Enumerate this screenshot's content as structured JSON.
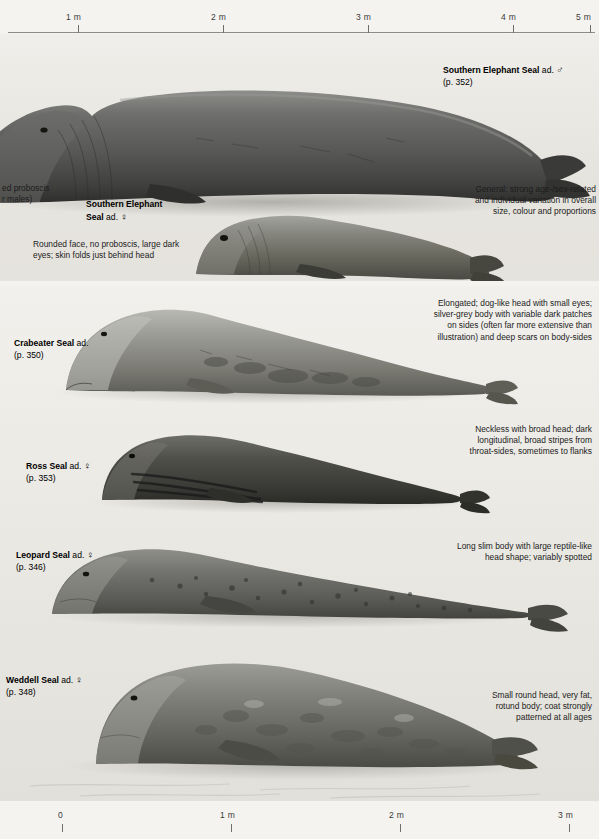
{
  "scales": {
    "top": {
      "name": "top-scale-bar",
      "ticks": [
        {
          "label": "1 m",
          "pos": 0.2
        },
        {
          "label": "2 m",
          "pos": 0.4
        },
        {
          "label": "3 m",
          "pos": 0.6
        },
        {
          "label": "4 m",
          "pos": 0.8
        },
        {
          "label": "5 m",
          "pos": 1.0
        }
      ]
    },
    "bottom": {
      "name": "bottom-scale-bar",
      "ticks": [
        {
          "label": "0",
          "pos": 0.0
        },
        {
          "label": "1 m",
          "pos": 0.3333
        },
        {
          "label": "2 m",
          "pos": 0.6667
        },
        {
          "label": "3 m",
          "pos": 1.0
        }
      ]
    }
  },
  "species": [
    {
      "id": "southern-elephant-seal-male",
      "common_name": "Southern Elephant Seal",
      "age_sex": "ad.",
      "sex_symbol": "♂",
      "page_ref": "(p. 352)"
    },
    {
      "id": "southern-elephant-seal-female",
      "common_name_line1": "Southern Elephant",
      "common_name_line2": "Seal",
      "age_sex": "ad.",
      "sex_symbol": "♀",
      "page_ref": ""
    },
    {
      "id": "crabeater-seal",
      "common_name": "Crabeater Seal",
      "age_sex": "ad.",
      "sex_symbol": "",
      "page_ref": "(p. 350)"
    },
    {
      "id": "ross-seal",
      "common_name": "Ross Seal",
      "age_sex": "ad.",
      "sex_symbol": "♀",
      "page_ref": "(p. 353)"
    },
    {
      "id": "leopard-seal",
      "common_name": "Leopard Seal",
      "age_sex": "ad.",
      "sex_symbol": "♀",
      "page_ref": "(p. 346)"
    },
    {
      "id": "weddell-seal",
      "common_name": "Weddell Seal",
      "age_sex": "ad.",
      "sex_symbol": "♀",
      "page_ref": "(p. 348)"
    }
  ],
  "captions": {
    "clipped_left_top": "ed proboscis\nr males)",
    "elephant_female_note": "Rounded face, no proboscis, large dark\neyes; skin folds just behind head",
    "general_note": "General: strong age-/sex-related\nand individual variation in overall\nsize, colour and proportions",
    "crabeater_note": "Elongated; dog-like head with small eyes;\nsilver-grey body with variable dark patches\non sides (often far more extensive than\nillustration) and deep scars on body-sides",
    "ross_note": "Neckless with broad head; dark\nlongitudinal, broad stripes from\nthroat-sides, sometimes to flanks",
    "leopard_note": "Long slim body with large reptile-like\nhead shape; variably spotted",
    "weddell_note": "Small round head, very fat,\nrotund body; coat strongly\npatterned at all ages"
  },
  "colors": {
    "page_background": "#f4f3f0",
    "plate_background": "#efeeea",
    "text": "#1b1b1b",
    "rule": "#8b8b88"
  }
}
